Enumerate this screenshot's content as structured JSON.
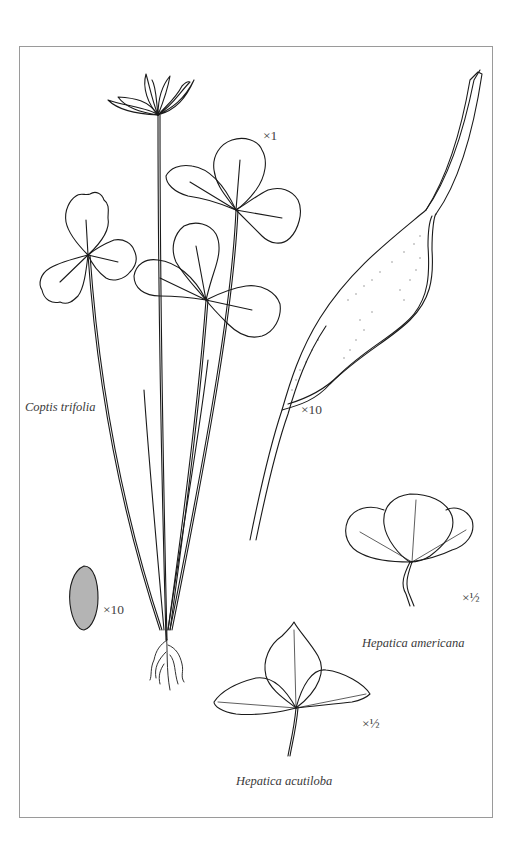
{
  "plate": {
    "border_color": "#9a9a9a",
    "ink_color": "#1a1a1a"
  },
  "specimens": [
    {
      "id": "coptis",
      "name": "Coptis trifolia",
      "scale": "×1"
    },
    {
      "id": "capsule",
      "name": "",
      "scale": "×10"
    },
    {
      "id": "seed",
      "name": "",
      "scale": "×10"
    },
    {
      "id": "hep-am",
      "name": "Hepatica americana",
      "scale": "×½"
    },
    {
      "id": "hep-ac",
      "name": "Hepatica acutiloba",
      "scale": "×½"
    }
  ]
}
